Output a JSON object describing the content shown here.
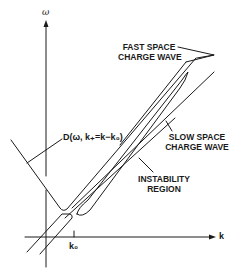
{
  "diagram": {
    "axes": {
      "vertical_label": "ω",
      "horizontal_label": "k",
      "tick_label": "k₀"
    },
    "labels": {
      "fast_wave_line1": "FAST SPACE",
      "fast_wave_line2": "CHARGE WAVE",
      "slow_wave_line1": "SLOW SPACE",
      "slow_wave_line2": "CHARGE WAVE",
      "instability_line1": "INSTABILITY",
      "instability_line2": "REGION",
      "dispersion": "D(ω, k₊=k−k₀)"
    },
    "colors": {
      "ink": "#1a1a1a",
      "background": "#ffffff"
    }
  }
}
